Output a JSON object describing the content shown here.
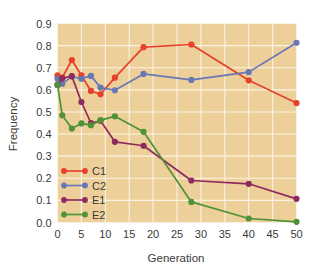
{
  "chart_data": {
    "type": "line",
    "title": "",
    "xlabel": "Generation",
    "ylabel": "Frequency",
    "xlim": [
      0,
      50
    ],
    "ylim": [
      0.0,
      0.9
    ],
    "xticks": [
      0,
      5,
      10,
      15,
      20,
      25,
      30,
      35,
      40,
      45,
      50
    ],
    "xtick_labels": [
      "0",
      "5",
      "10",
      "15",
      "20",
      "25",
      "30",
      "35",
      "40",
      "45",
      "50"
    ],
    "yticks": [
      0.0,
      0.1,
      0.2,
      0.3,
      0.4,
      0.5,
      0.6,
      0.7,
      0.8,
      0.9
    ],
    "ytick_labels": [
      "0.0",
      "0.1",
      "0.2",
      "0.3",
      "0.4",
      "0.5",
      "0.6",
      "0.7",
      "0.8",
      "0.9"
    ],
    "grid": true,
    "legend_position": "lower-left-inside",
    "plot_background": "#edcf9a",
    "grid_color": "#fbf3e2",
    "series": [
      {
        "name": "C1",
        "color": "#e8402a",
        "x": [
          0,
          1,
          3,
          5,
          7,
          9,
          12,
          18,
          28,
          40,
          50
        ],
        "y": [
          0.665,
          0.655,
          0.735,
          0.665,
          0.595,
          0.58,
          0.655,
          0.793,
          0.805,
          0.643,
          0.54
        ]
      },
      {
        "name": "C2",
        "color": "#6878b4",
        "x": [
          0,
          1,
          3,
          5,
          7,
          9,
          12,
          18,
          28,
          40,
          50
        ],
        "y": [
          0.65,
          0.628,
          0.66,
          0.65,
          0.663,
          0.61,
          0.598,
          0.672,
          0.645,
          0.68,
          0.813
        ]
      },
      {
        "name": "E1",
        "color": "#8e2a5e",
        "x": [
          0,
          1,
          3,
          5,
          7,
          9,
          12,
          18,
          28,
          40,
          50
        ],
        "y": [
          0.622,
          0.652,
          0.662,
          0.545,
          0.45,
          0.46,
          0.365,
          0.347,
          0.19,
          0.175,
          0.107
        ]
      },
      {
        "name": "E2",
        "color": "#4f9237",
        "x": [
          0,
          1,
          3,
          5,
          7,
          9,
          12,
          18,
          28,
          40,
          50
        ],
        "y": [
          0.622,
          0.485,
          0.425,
          0.448,
          0.44,
          0.463,
          0.48,
          0.41,
          0.093,
          0.018,
          0.003
        ]
      }
    ]
  },
  "legend": {
    "entries": [
      {
        "label": "C1",
        "color": "#e8402a"
      },
      {
        "label": "C2",
        "color": "#6878b4"
      },
      {
        "label": "E1",
        "color": "#8e2a5e"
      },
      {
        "label": "E2",
        "color": "#4f9237"
      }
    ]
  }
}
